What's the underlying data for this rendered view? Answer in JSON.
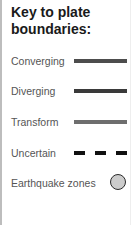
{
  "legend": {
    "title_line1": "Key to plate",
    "title_line2": "boundaries:",
    "items": [
      {
        "label": "Converging",
        "symbol": "solid-line",
        "color": "#4d4d4d"
      },
      {
        "label": "Diverging",
        "symbol": "solid-line",
        "color": "#3a3a3a"
      },
      {
        "label": "Transform",
        "symbol": "solid-line",
        "color": "#6e6e6e"
      },
      {
        "label": "Uncertain",
        "symbol": "dashed-line",
        "color": "#111111"
      },
      {
        "label": "Earthquake zones",
        "symbol": "circle",
        "color": "#cccccc"
      }
    ]
  }
}
